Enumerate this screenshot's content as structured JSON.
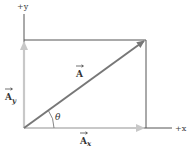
{
  "diagram": {
    "axes": {
      "x_label": "+x",
      "y_label": "+y"
    },
    "vectors": {
      "resultant": {
        "label": "A",
        "color": "#777777"
      },
      "x_component": {
        "label": "A",
        "subscript": "x",
        "color": "#c8c8c8"
      },
      "y_component": {
        "label": "A",
        "subscript": "y",
        "color": "#c8c8c8"
      }
    },
    "angle": {
      "label": "θ"
    },
    "colors": {
      "axis": "#555555",
      "box": "#555555",
      "resultant": "#777777",
      "components": "#c8c8c8"
    }
  }
}
